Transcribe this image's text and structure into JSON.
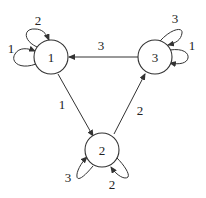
{
  "diagram": {
    "type": "directed-graph",
    "nodes": [
      {
        "id": "1",
        "label": "1"
      },
      {
        "id": "2",
        "label": "2"
      },
      {
        "id": "3",
        "label": "3"
      }
    ],
    "edges": [
      {
        "from": "3",
        "to": "1",
        "label": "3"
      },
      {
        "from": "1",
        "to": "2",
        "label": "1"
      },
      {
        "from": "2",
        "to": "3",
        "label": "2"
      }
    ],
    "self_loops": [
      {
        "node": "1",
        "label": "1",
        "position": "left"
      },
      {
        "node": "1",
        "label": "2",
        "position": "top"
      },
      {
        "node": "3",
        "label": "3",
        "position": "top-right"
      },
      {
        "node": "3",
        "label": "1",
        "position": "right"
      },
      {
        "node": "2",
        "label": "3",
        "position": "bottom-left"
      },
      {
        "node": "2",
        "label": "2",
        "position": "bottom-right"
      }
    ]
  }
}
